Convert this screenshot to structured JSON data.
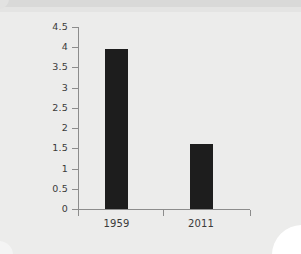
{
  "chart_data": {
    "type": "bar",
    "title": "",
    "subtitle": "",
    "xlabel": "",
    "ylabel": "",
    "categories": [
      "1959",
      "2011"
    ],
    "values": [
      3.95,
      1.6
    ],
    "series": [
      {
        "name": "",
        "values": [
          3.95,
          1.6
        ]
      }
    ],
    "ylim": [
      0,
      4.5
    ],
    "yticks": [
      0,
      0.5,
      1,
      1.5,
      2,
      2.5,
      3,
      3.5,
      4,
      4.5
    ],
    "ytick_labels": [
      "0",
      "0.5",
      "1",
      "1.5",
      "2",
      "2.5",
      "3",
      "3.5",
      "4",
      "4.5"
    ],
    "xtick_labels": [
      "1959",
      "2011"
    ],
    "grid": false,
    "legend": false,
    "legend_position": "none",
    "annotations": [],
    "bar_color": "#1d1d1d",
    "axis_color": "#8c8c8c",
    "background_color": "#ececeb",
    "text_color": "#3a3a3a"
  }
}
